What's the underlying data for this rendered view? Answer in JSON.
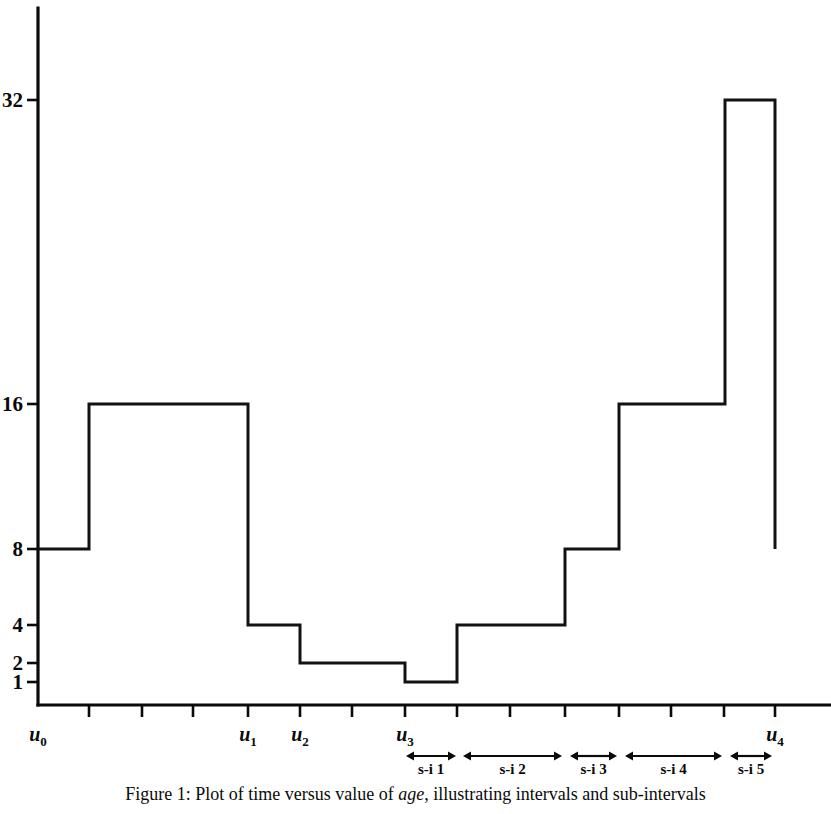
{
  "figure": {
    "caption_prefix": "Figure 1: Plot of time versus value of ",
    "caption_emphasis": "age",
    "caption_suffix": ", illustrating intervals and sub-intervals"
  },
  "chart_data": {
    "type": "line",
    "subtype": "step",
    "title": "",
    "xlabel": "",
    "ylabel": "",
    "y_scale": "log2",
    "y_tick_values": [
      1,
      2,
      4,
      8,
      16,
      32
    ],
    "y_tick_labels": [
      "1",
      "2",
      "4",
      "8",
      "16",
      "32"
    ],
    "ylim": [
      1,
      40
    ],
    "x_tick_labels": [
      "u",
      "",
      "",
      "",
      "u",
      "u",
      "",
      "u",
      "",
      "",
      "",
      "",
      "",
      "u"
    ],
    "x_axis_named_ticks": [
      {
        "label_base": "u",
        "label_sub": "0",
        "x": 38
      },
      {
        "label_base": "u",
        "label_sub": "1",
        "x": 248
      },
      {
        "label_base": "u",
        "label_sub": "2",
        "x": 300
      },
      {
        "label_base": "u",
        "label_sub": "3",
        "x": 405
      },
      {
        "label_base": "u",
        "label_sub": "4",
        "x": 775
      }
    ],
    "x_tick_positions": [
      89,
      142,
      193,
      248,
      300,
      352,
      405,
      457,
      510,
      565,
      619,
      671,
      724,
      775
    ],
    "steps": [
      {
        "x_start": 38,
        "x_end": 89,
        "value": 8
      },
      {
        "x_start": 89,
        "x_end": 248,
        "value": 16
      },
      {
        "x_start": 248,
        "x_end": 300,
        "value": 4
      },
      {
        "x_start": 300,
        "x_end": 405,
        "value": 2
      },
      {
        "x_start": 405,
        "x_end": 457,
        "value": 1
      },
      {
        "x_start": 457,
        "x_end": 565,
        "value": 4
      },
      {
        "x_start": 565,
        "x_end": 619,
        "value": 8
      },
      {
        "x_start": 619,
        "x_end": 725,
        "value": 16
      },
      {
        "x_start": 725,
        "x_end": 775,
        "value": 32
      }
    ],
    "final_drop_value": 8,
    "annotations": [
      {
        "name": "s-i 1",
        "label": "s-i 1",
        "x_start": 406,
        "x_end": 456
      },
      {
        "name": "s-i 2",
        "label": "s-i 2",
        "x_start": 463,
        "x_end": 562
      },
      {
        "name": "s-i 3",
        "label": "s-i 3",
        "x_start": 570,
        "x_end": 617
      },
      {
        "name": "s-i 4",
        "label": "s-i 4",
        "x_start": 625,
        "x_end": 722
      },
      {
        "name": "s-i 5",
        "label": "s-i 5",
        "x_start": 730,
        "x_end": 772
      }
    ],
    "grid": false,
    "legend": null,
    "line_color": "#121212",
    "axis_color": "#0a0a0a"
  }
}
